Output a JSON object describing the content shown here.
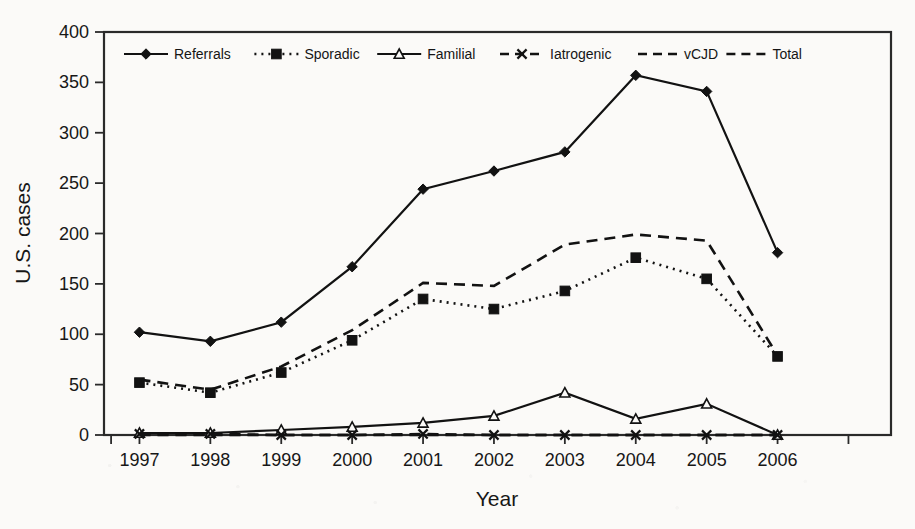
{
  "chart_data": {
    "type": "line",
    "title": "",
    "xlabel": "Year",
    "ylabel": "U.S. cases",
    "categories": [
      "1997",
      "1998",
      "1999",
      "2000",
      "2001",
      "2002",
      "2003",
      "2004",
      "2005",
      "2006"
    ],
    "x": [
      1997,
      1998,
      1999,
      2000,
      2001,
      2002,
      2003,
      2004,
      2005,
      2006
    ],
    "xlim": [
      1996.5,
      2007.6
    ],
    "ylim": [
      0,
      400
    ],
    "yticks": [
      0,
      50,
      100,
      150,
      200,
      250,
      300,
      350,
      400
    ],
    "xticks": [
      "1997",
      "1998",
      "1999",
      "2000",
      "2001",
      "2002",
      "2003",
      "2004",
      "2005",
      "2006"
    ],
    "grid": false,
    "legend_position": "top-inside",
    "series": [
      {
        "name": "Referrals",
        "marker": "diamond",
        "dash": "solid",
        "values": [
          102,
          93,
          112,
          167,
          244,
          262,
          281,
          357,
          341,
          181
        ]
      },
      {
        "name": "Sporadic",
        "marker": "square",
        "dash": "dotted",
        "values": [
          52,
          42,
          62,
          94,
          135,
          125,
          143,
          176,
          155,
          78
        ]
      },
      {
        "name": "Familial",
        "marker": "triangle",
        "dash": "solid",
        "values": [
          2,
          2,
          5,
          8,
          12,
          19,
          42,
          16,
          31,
          0
        ]
      },
      {
        "name": "Iatrogenic",
        "marker": "x",
        "dash": "dashed",
        "values": [
          1,
          1,
          0,
          0,
          1,
          0,
          0,
          0,
          0,
          0
        ]
      },
      {
        "name": "vCJD",
        "marker": "none",
        "dash": "dashed",
        "values": [
          0,
          0,
          0,
          0,
          0,
          0,
          0,
          0,
          0,
          0
        ]
      },
      {
        "name": "Total",
        "marker": "none",
        "dash": "dashed",
        "values": [
          55,
          45,
          68,
          104,
          151,
          148,
          189,
          199,
          193,
          79
        ]
      }
    ]
  },
  "legend": {
    "items": [
      {
        "label": "Referrals"
      },
      {
        "label": "Sporadic"
      },
      {
        "label": "Familial"
      },
      {
        "label": "Iatrogenic"
      },
      {
        "label": "vCJD"
      },
      {
        "label": "Total"
      }
    ]
  },
  "colors": {
    "ink": "#121212",
    "axis": "#2a2a2a",
    "background": "#fbfaf8"
  }
}
